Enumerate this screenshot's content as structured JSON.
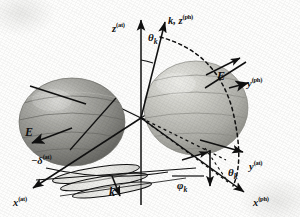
{
  "figure": {
    "kind": "3d-vector-diagram",
    "background_color": "#fdfdfc",
    "ink_color": "#101010",
    "sphere_left_color": "#8d8d8a",
    "sphere_right_color": "#b9b9b3"
  },
  "axes": [
    {
      "id": "z-at",
      "label_main": "z",
      "label_sup": "(at)",
      "x": 112,
      "y": 22,
      "kind": "solid-arrow"
    },
    {
      "id": "k-zph",
      "label_main": "k, z",
      "label_sup": "(ph)",
      "x": 168,
      "y": 14,
      "kind": "solid-arrow"
    },
    {
      "id": "y-ph",
      "label_main": "y",
      "label_sup": "(ph)",
      "x": 247,
      "y": 77,
      "kind": "solid-arrow"
    },
    {
      "id": "y-at",
      "label_main": "y",
      "label_sup": "(at)",
      "x": 249,
      "y": 160,
      "kind": "solid-arrow"
    },
    {
      "id": "x-ph",
      "label_main": "x",
      "label_sup": "(ph)",
      "x": 253,
      "y": 196,
      "kind": "solid-arrow"
    },
    {
      "id": "x-at",
      "label_main": "x",
      "label_sup": "(at)",
      "x": 13,
      "y": 196,
      "kind": "solid-arrow"
    }
  ],
  "vectors": [
    {
      "id": "E-left",
      "label": "E",
      "x": 25,
      "y": 126
    },
    {
      "id": "E-right",
      "label": "E",
      "x": 217,
      "y": 70
    },
    {
      "id": "k-lower",
      "label": "k",
      "x": 109,
      "y": 186
    }
  ],
  "angles": [
    {
      "id": "theta-k-top",
      "label_main": "θ",
      "label_sub": "k",
      "x": 148,
      "y": 32
    },
    {
      "id": "theta-k-bottom",
      "label_main": "θ",
      "label_sub": "k",
      "x": 228,
      "y": 167
    },
    {
      "id": "phi-k",
      "label_main": "φ",
      "label_sub": "k",
      "x": 177,
      "y": 180
    }
  ],
  "phase": {
    "id": "delta-at",
    "label_main": "−δ",
    "label_sup": "(at)",
    "x": 31,
    "y": 154
  }
}
